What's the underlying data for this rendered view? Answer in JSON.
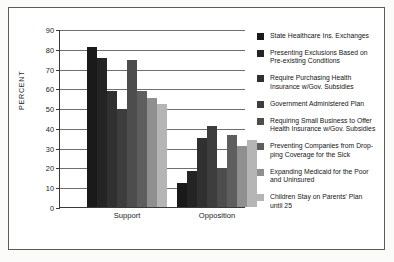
{
  "chart_data": {
    "type": "bar",
    "title": "",
    "xlabel": "",
    "ylabel": "PERCENT",
    "ylim": [
      0,
      90
    ],
    "ytick_values": [
      90,
      80,
      70,
      60,
      50,
      40,
      30,
      20,
      10,
      0
    ],
    "ytick_labels": [
      "90",
      "80",
      "70",
      "60",
      "50",
      "40",
      "30",
      "20",
      "10",
      "0"
    ],
    "grid": "horizontal",
    "legend_position": "right",
    "categories": [
      "Support",
      "Opposition"
    ],
    "series": [
      {
        "name": "State Healthcare Ins. Exchanges",
        "color": "#1a1a1a",
        "values": [
          81,
          12
        ]
      },
      {
        "name": "Presenting Exclusions Based on\nPre-existing Conditions",
        "color": "#242424",
        "values": [
          75.5,
          18
        ]
      },
      {
        "name": "Require Purchasing Health\nInsurance w/Gov. Subsidies",
        "color": "#303030",
        "values": [
          58.5,
          35
        ]
      },
      {
        "name": "Government Administered Plan",
        "color": "#3d3d3d",
        "values": [
          49.5,
          41
        ]
      },
      {
        "name": "Requiring Small Business to Offer\nHealth Insurance w/Gov. Subsidies",
        "color": "#4d4d4d",
        "values": [
          74.5,
          19.5
        ]
      },
      {
        "name": "Preventing Companies from Drop-\nping Coverage for the Sick",
        "color": "#5e5e5e",
        "values": [
          58.5,
          36.5
        ]
      },
      {
        "name": "Expanding Medicaid for the Poor\nand Uninsured",
        "color": "#8f8f8f",
        "values": [
          55,
          31
        ]
      },
      {
        "name": "Children Stay on Parents' Plan\nuntil  25",
        "color": "#b5b5b5",
        "values": [
          52,
          34
        ]
      }
    ]
  }
}
